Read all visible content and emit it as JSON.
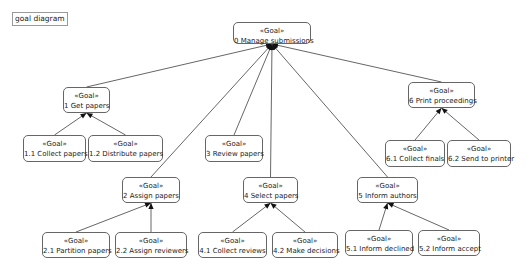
{
  "diagram": {
    "title": "goal diagram",
    "stereotype": "«Goal»",
    "colors": {
      "line": "#555555",
      "border": "#666666",
      "background": "#ffffff"
    },
    "nodes": [
      {
        "id": "0",
        "label": "0  Manage submissions",
        "x": 233,
        "y": 22,
        "w": 78,
        "h": 22
      },
      {
        "id": "1",
        "label": "1  Get papers",
        "x": 63,
        "y": 87,
        "w": 47,
        "h": 26
      },
      {
        "id": "1.1",
        "label": "1.1  Collect papers",
        "x": 23,
        "y": 135,
        "w": 63,
        "h": 27
      },
      {
        "id": "1.2",
        "label": "1.2  Distribute papers",
        "x": 88,
        "y": 135,
        "w": 75,
        "h": 27
      },
      {
        "id": "2",
        "label": "2  Assign papers",
        "x": 122,
        "y": 177,
        "w": 58,
        "h": 26
      },
      {
        "id": "2.1",
        "label": "2.1  Partition papers",
        "x": 42,
        "y": 232,
        "w": 68,
        "h": 26
      },
      {
        "id": "2.2",
        "label": "2.2  Assign reviewers",
        "x": 115,
        "y": 232,
        "w": 72,
        "h": 26
      },
      {
        "id": "3",
        "label": "3  Review papers",
        "x": 205,
        "y": 135,
        "w": 58,
        "h": 27
      },
      {
        "id": "4",
        "label": "4  Select papers",
        "x": 243,
        "y": 177,
        "w": 55,
        "h": 26
      },
      {
        "id": "4.1",
        "label": "4.1  Collect reviews",
        "x": 198,
        "y": 232,
        "w": 69,
        "h": 26
      },
      {
        "id": "4.2",
        "label": "4.2  Make decisions",
        "x": 272,
        "y": 232,
        "w": 66,
        "h": 26
      },
      {
        "id": "5",
        "label": "5  Inform authors",
        "x": 357,
        "y": 177,
        "w": 61,
        "h": 26
      },
      {
        "id": "5.1",
        "label": "5.1  Inform declined",
        "x": 345,
        "y": 230,
        "w": 68,
        "h": 26
      },
      {
        "id": "5.2",
        "label": "5.2  Inform accept",
        "x": 418,
        "y": 230,
        "w": 62,
        "h": 26
      },
      {
        "id": "6",
        "label": "6  Print proceedings",
        "x": 408,
        "y": 82,
        "w": 67,
        "h": 26
      },
      {
        "id": "6.1",
        "label": "6.1  Collect finals",
        "x": 385,
        "y": 140,
        "w": 60,
        "h": 27
      },
      {
        "id": "6.2",
        "label": "6.2  Send to printer",
        "x": 447,
        "y": 140,
        "w": 64,
        "h": 27
      }
    ],
    "edges": [
      {
        "from": "1",
        "to": "0"
      },
      {
        "from": "2",
        "to": "0"
      },
      {
        "from": "3",
        "to": "0"
      },
      {
        "from": "4",
        "to": "0"
      },
      {
        "from": "5",
        "to": "0"
      },
      {
        "from": "6",
        "to": "0"
      },
      {
        "from": "1.1",
        "to": "1"
      },
      {
        "from": "1.2",
        "to": "1"
      },
      {
        "from": "2.1",
        "to": "2"
      },
      {
        "from": "2.2",
        "to": "2"
      },
      {
        "from": "4.1",
        "to": "4"
      },
      {
        "from": "4.2",
        "to": "4"
      },
      {
        "from": "5.1",
        "to": "5"
      },
      {
        "from": "5.2",
        "to": "5"
      },
      {
        "from": "6.1",
        "to": "6"
      },
      {
        "from": "6.2",
        "to": "6"
      }
    ]
  }
}
